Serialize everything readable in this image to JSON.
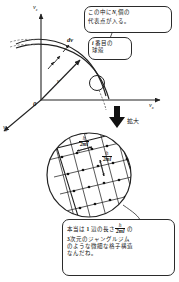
{
  "figure": {
    "type": "physics-diagram",
    "language": "ja"
  },
  "axes": {
    "vertical_label": "v",
    "vertical_sub": "z",
    "horizontal_label": "v",
    "horizontal_sub": "x",
    "depth_label": "v",
    "depth_sub": "y",
    "origin_label": "0"
  },
  "annotations": {
    "dv_label": "dv",
    "v_vector_label": "v",
    "zoom_label": "拡大"
  },
  "callouts": {
    "shell_count": {
      "line1_a": "この中に",
      "line1_var": "N",
      "line1_sub": "i",
      "line1_b": "個の",
      "line2": "代表点が入る。"
    },
    "shell_index": {
      "line1_var": "i",
      "line1_b": " 番目の",
      "line2": "球殻"
    },
    "lattice_note": {
      "line1_a": "本当は ",
      "line1_num": "1",
      "line1_b": " 辺の長さ",
      "frac_num": "h",
      "frac_den": "2ml",
      "line1_c": " の",
      "line2_num": "3",
      "line2_b": "次元のジャングルジム",
      "line3": "のような微細な格子構造",
      "line4": "なんだね。"
    }
  },
  "lattice": {
    "spacing_label_num": "h",
    "spacing_label_den": "2ml",
    "spacing_label_1": "h/2ml",
    "spacing_label_2": "h/2ml"
  },
  "colors": {
    "ink": "#222222",
    "line": "#2b2b2b",
    "background": "#ffffff"
  }
}
